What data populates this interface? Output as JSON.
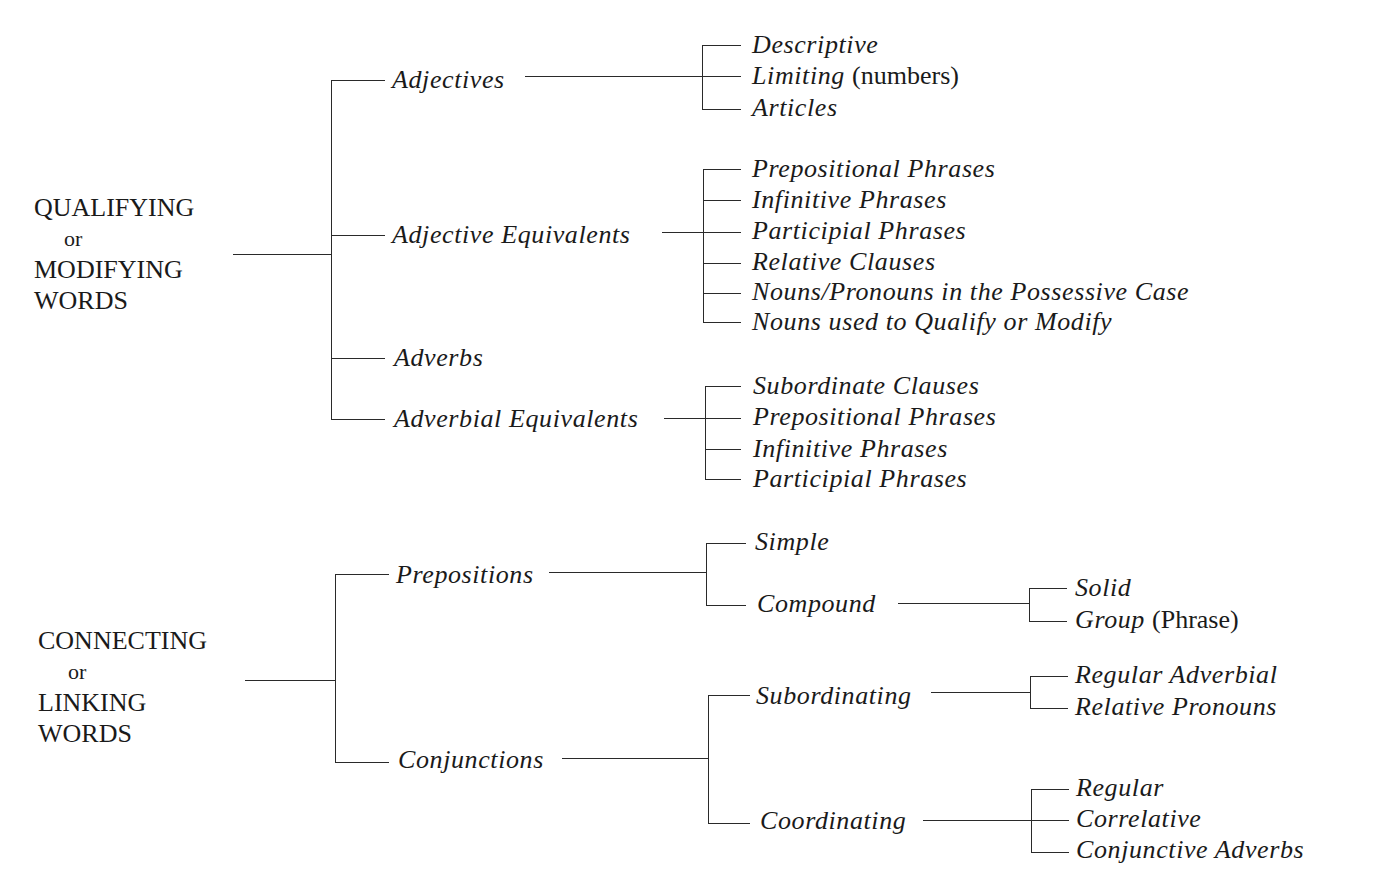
{
  "diagram": {
    "type": "tree",
    "sections": [
      {
        "root_lines": [
          "QUALIFYING",
          "or",
          "MODIFYING",
          "WORDS"
        ],
        "children": [
          {
            "label": "Adjectives",
            "children": [
              {
                "label": "Descriptive"
              },
              {
                "label": "Limiting",
                "note": "(numbers)"
              },
              {
                "label": "Articles"
              }
            ]
          },
          {
            "label": "Adjective Equivalents",
            "children": [
              {
                "label": "Prepositional Phrases"
              },
              {
                "label": "Infinitive Phrases"
              },
              {
                "label": "Participial Phrases"
              },
              {
                "label": "Relative Clauses"
              },
              {
                "label": "Nouns/Pronouns in the Possessive Case"
              },
              {
                "label": "Nouns used to Qualify or Modify"
              }
            ]
          },
          {
            "label": "Adverbs",
            "children": []
          },
          {
            "label": "Adverbial Equivalents",
            "children": [
              {
                "label": "Subordinate Clauses"
              },
              {
                "label": "Prepositional Phrases"
              },
              {
                "label": "Infinitive Phrases"
              },
              {
                "label": "Participial Phrases"
              }
            ]
          }
        ]
      },
      {
        "root_lines": [
          "CONNECTING",
          "or",
          "LINKING",
          "WORDS"
        ],
        "children": [
          {
            "label": "Prepositions",
            "children": [
              {
                "label": "Simple",
                "children": []
              },
              {
                "label": "Compound",
                "children": [
                  {
                    "label": "Solid"
                  },
                  {
                    "label": "Group",
                    "note": "(Phrase)"
                  }
                ]
              }
            ]
          },
          {
            "label": "Conjunctions",
            "children": [
              {
                "label": "Subordinating",
                "children": [
                  {
                    "label": "Regular Adverbial"
                  },
                  {
                    "label": "Relative Pronouns"
                  }
                ]
              },
              {
                "label": "Coordinating",
                "children": [
                  {
                    "label": "Regular"
                  },
                  {
                    "label": "Correlative"
                  },
                  {
                    "label": "Conjunctive Adverbs"
                  }
                ]
              }
            ]
          }
        ]
      }
    ]
  }
}
